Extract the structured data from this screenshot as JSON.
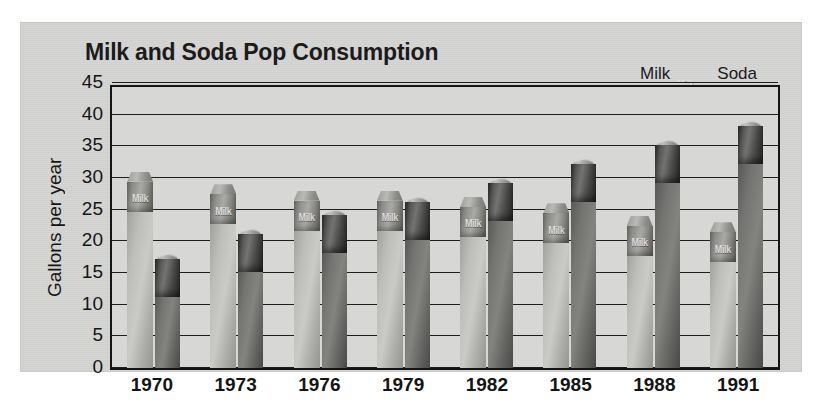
{
  "chart_data": {
    "type": "bar",
    "title": "Milk and Soda Pop Consumption",
    "xlabel": "",
    "ylabel": "Gallons per year",
    "categories": [
      "1970",
      "1973",
      "1976",
      "1979",
      "1982",
      "1985",
      "1988",
      "1991"
    ],
    "series": [
      {
        "name": "Milk",
        "values": [
          31,
          29,
          28,
          28,
          27,
          26,
          24,
          23
        ]
      },
      {
        "name": "Soda",
        "values": [
          18,
          22,
          25,
          27,
          30,
          33,
          36,
          39
        ]
      }
    ],
    "ylim": [
      0,
      45
    ],
    "yticks": [
      45,
      40,
      35,
      30,
      25,
      20,
      15,
      10,
      5,
      0
    ],
    "grid": true,
    "legend_position": "top-right",
    "legend": [
      {
        "label": "Milk",
        "icon": "milk-carton-icon",
        "color": "#bdbdba"
      },
      {
        "label": "Soda",
        "icon": "soda-can-icon",
        "color": "#6a6a68"
      }
    ]
  },
  "figure": {
    "background_color": "#d4d4d2",
    "axis_color": "#141414"
  }
}
